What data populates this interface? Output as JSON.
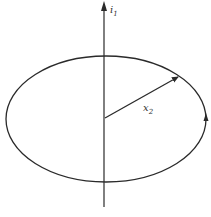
{
  "diagram": {
    "axis_label": "i",
    "axis_label_sub": "1",
    "radius_label": "x",
    "radius_label_sub": "2",
    "stroke_color": "#2a2a2a",
    "text_color": "#333333"
  }
}
